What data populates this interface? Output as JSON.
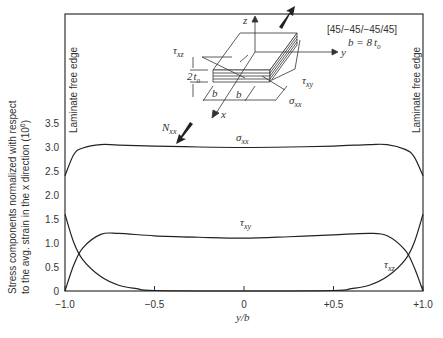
{
  "chart_data": {
    "type": "line",
    "title": "",
    "xlabel": "y/b",
    "ylabel": "Stress components normalized with respect to the avg. strain in the x direction (10^6)",
    "ylabel_line1": "Stress components normalized with respect",
    "ylabel_line2": "to the avg. strain in the x direction (10",
    "ylabel_exp": "6",
    "xlim": [
      -1.0,
      1.0
    ],
    "ylim": [
      0,
      3.5
    ],
    "x_ticks": [
      "-1.0",
      "-0.5",
      "0",
      "+0.5",
      "+1.0"
    ],
    "y_ticks": [
      "0",
      "0.5",
      "1.0",
      "1.5",
      "2.0",
      "2.5",
      "3.0",
      "3.5"
    ],
    "grid": false,
    "series": [
      {
        "name": "σxx",
        "x": [
          -1.0,
          -0.95,
          -0.9,
          -0.8,
          -0.7,
          -0.5,
          -0.25,
          0,
          0.25,
          0.5,
          0.7,
          0.8,
          0.9,
          0.95,
          1.0
        ],
        "values": [
          2.4,
          2.85,
          2.98,
          3.05,
          3.04,
          3.02,
          3.0,
          2.99,
          3.0,
          3.02,
          3.05,
          3.05,
          2.95,
          2.8,
          2.4
        ]
      },
      {
        "name": "τxy",
        "x": [
          -1.0,
          -0.95,
          -0.9,
          -0.8,
          -0.7,
          -0.5,
          -0.25,
          0,
          0.25,
          0.5,
          0.7,
          0.8,
          0.9,
          0.95,
          1.0
        ],
        "values": [
          0.0,
          0.55,
          0.9,
          1.18,
          1.2,
          1.15,
          1.12,
          1.1,
          1.13,
          1.17,
          1.2,
          1.15,
          0.85,
          0.5,
          0.0
        ]
      },
      {
        "name": "τxz",
        "x": [
          -1.0,
          -0.95,
          -0.9,
          -0.8,
          -0.7,
          -0.6,
          -0.5,
          0,
          0.5,
          0.6,
          0.7,
          0.8,
          0.9,
          0.95,
          1.0
        ],
        "values": [
          1.6,
          1.0,
          0.65,
          0.3,
          0.12,
          0.05,
          0.01,
          0.0,
          0.01,
          0.05,
          0.12,
          0.3,
          0.65,
          1.0,
          1.6
        ]
      }
    ],
    "annotations": [
      "Laminate free edge (left)",
      "Laminate free edge (right)",
      "[45/−45/−45/45]",
      "b = 8 t0",
      "Nxx",
      "σxx",
      "τxy",
      "τxz",
      "2 t0"
    ]
  },
  "labels": {
    "free_edge": "Laminate free edge",
    "layup": "[45/−45/−45/45]",
    "b_eq": "b = 8",
    "t0": "t",
    "t0_sub": "0",
    "sigma": "σ",
    "tau": "τ",
    "xx": "xx",
    "xy": "xy",
    "xz": "xz",
    "N": "N",
    "two": "2",
    "b": "b",
    "x": "x",
    "y": "y",
    "z": "z",
    "xlabel": "y/b"
  }
}
